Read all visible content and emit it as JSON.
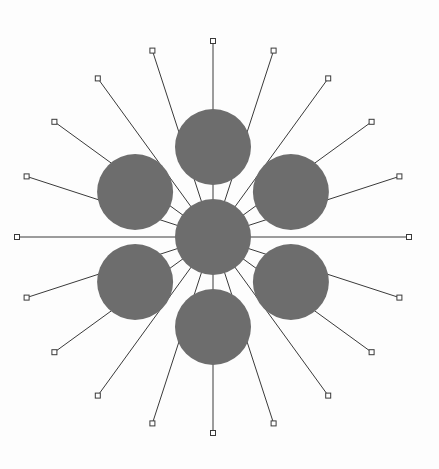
{
  "diagram": {
    "type": "radial-hub",
    "colors": {
      "node_fill": "#6d6d6d",
      "line": "#3a3a3a",
      "endpoint_fill": "#ffffff",
      "background": "#fdfdfd"
    },
    "spoke_count": 20,
    "spoke_angle_step_deg": 18,
    "satellite_count": 6,
    "nodes": [
      {
        "id": "center",
        "role": "hub"
      },
      {
        "id": "top",
        "role": "satellite",
        "angle_deg": 0
      },
      {
        "id": "upper-right",
        "role": "satellite",
        "angle_deg": 60
      },
      {
        "id": "lower-right",
        "role": "satellite",
        "angle_deg": 120
      },
      {
        "id": "bottom",
        "role": "satellite",
        "angle_deg": 180
      },
      {
        "id": "lower-left",
        "role": "satellite",
        "angle_deg": 240
      },
      {
        "id": "upper-left",
        "role": "satellite",
        "angle_deg": 300
      }
    ],
    "endpoint_shape": "square"
  }
}
